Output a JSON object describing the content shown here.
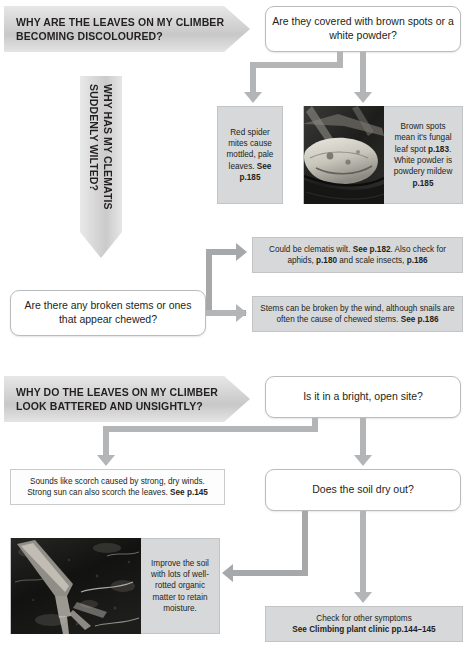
{
  "page": {
    "colors": {
      "answer_box_grey": "#d7d8da",
      "connector_grey": "#b3b5b7",
      "banner_grey": "#d2d2d2",
      "text": "#231f20"
    }
  },
  "section1": {
    "banner": "WHY ARE THE LEAVES ON MY CLIMBER BECOMING DISCOLOURED?",
    "banner_line1": "WHY ARE THE LEAVES ON MY CLIMBER",
    "banner_line2": "BECOMING DISCOLOURED?",
    "vertical_banner": "WHY HAS MY CLEMATIS\nSUDDENLY WILTED?",
    "question1": "Are they covered with brown spots or a white powder?",
    "answer_left": "Red spider mites cause mottled, pale leaves.",
    "answer_left_bold": "See p.185",
    "answer_right_1": "Brown spots mean it's fungal leaf spot ",
    "answer_right_b1": "p.183",
    "answer_right_2": ". White powder is powdery mildew ",
    "answer_right_b2": "p.185",
    "photo_alt": "Leaf with brown fungal spots",
    "question2": "Are there any broken stems or ones that appear chewed?",
    "answer_wilt_1": "Could be clematis wilt. ",
    "answer_wilt_b1": "See p.182",
    "answer_wilt_2": ". Also check for aphids, ",
    "answer_wilt_b2": "p.180",
    "answer_wilt_3": " and scale insects, ",
    "answer_wilt_b3": "p.186",
    "answer_stems_1": "Stems can be broken by the wind, although snails are often the cause of chewed stems. ",
    "answer_stems_b1": "See p.186"
  },
  "section2": {
    "banner_line1": "WHY DO THE LEAVES ON MY CLIMBER",
    "banner_line2": "LOOK BATTERED AND UNSIGHTLY?",
    "question1": "Is it in a bright, open site?",
    "answer_scorch_1": "Sounds like scorch caused by strong, dry winds. Strong sun can also scorch the leaves. ",
    "answer_scorch_b1": "See p.145",
    "question2": "Does the soil dry out?",
    "answer_soil": "Improve the soil with lots of well-rotted organic matter to retain moisture.",
    "photo_alt": "Garden fork digging organic matter into dark soil",
    "answer_clinic_1": "Check for other symptoms",
    "answer_clinic_b1": "See Climbing plant clinic pp.144–145"
  }
}
